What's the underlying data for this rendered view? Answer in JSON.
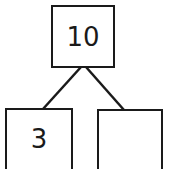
{
  "diagram": {
    "type": "number-bond",
    "whole": {
      "label": "10"
    },
    "parts": [
      {
        "label": "3"
      },
      {
        "label": ""
      }
    ],
    "colors": {
      "stroke": "#1a1a1a",
      "background": "#ffffff"
    }
  }
}
